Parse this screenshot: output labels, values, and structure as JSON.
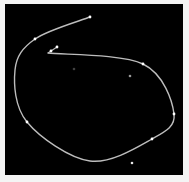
{
  "scene": {
    "background_color": "#000000",
    "margin_color": "#f4f4f4",
    "curve_color": "#bdbdbd",
    "point_color": "#ffffff",
    "curve": {
      "description": "open freehand stroke looping clockwise",
      "control_points": [
        [
          90,
          17
        ],
        [
          35,
          39
        ],
        [
          15,
          70
        ],
        [
          27,
          122
        ],
        [
          90,
          161
        ],
        [
          152,
          139
        ],
        [
          174,
          114
        ],
        [
          143,
          64
        ],
        [
          48,
          53
        ]
      ]
    },
    "curve_markers": [
      [
        90,
        17
      ],
      [
        35,
        39
      ],
      [
        27,
        122
      ],
      [
        152,
        139
      ],
      [
        174,
        114
      ],
      [
        143,
        64
      ],
      [
        51,
        51
      ],
      [
        57,
        47
      ]
    ],
    "isolated_points": [
      {
        "pos": [
          74,
          69
        ],
        "brightness": 0.25
      },
      {
        "pos": [
          130,
          76
        ],
        "brightness": 0.6
      },
      {
        "pos": [
          132,
          163
        ],
        "brightness": 0.9
      }
    ]
  }
}
